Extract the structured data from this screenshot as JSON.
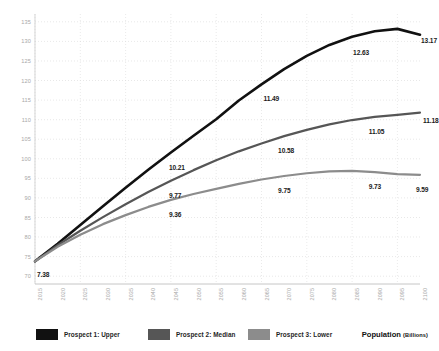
{
  "chart_data": {
    "type": "line",
    "title": "",
    "xlabel": "",
    "ylabel": "Population (Billions)",
    "ylim": [
      68,
      137
    ],
    "yticks": [
      70,
      75,
      80,
      85,
      90,
      95,
      100,
      105,
      110,
      115,
      120,
      125,
      130,
      135
    ],
    "grid": true,
    "legend_position": "bottom-left",
    "x": [
      2015,
      2020,
      2025,
      2030,
      2035,
      2040,
      2045,
      2050,
      2055,
      2060,
      2065,
      2070,
      2075,
      2080,
      2085,
      2090,
      2095,
      2100
    ],
    "xticklabels": [
      "2015",
      "2020",
      "2025",
      "2030",
      "2035",
      "2040",
      "2045",
      "2050",
      "2055",
      "2060",
      "2065",
      "2070",
      "2075",
      "2080",
      "2085",
      "2090",
      "2095",
      "2100"
    ],
    "series": [
      {
        "name": "Prospect 1: Upper",
        "color": "#111111",
        "values": [
          73.8,
          78.3,
          83.1,
          87.9,
          92.6,
          97.2,
          101.6,
          105.9,
          110.1,
          114.9,
          119.0,
          122.9,
          126.3,
          129.1,
          131.2,
          132.6,
          133.2,
          131.7
        ]
      },
      {
        "name": "Prospect 2: Median",
        "color": "#565656",
        "values": [
          73.8,
          77.9,
          81.6,
          85.1,
          88.4,
          91.5,
          94.4,
          97.1,
          99.6,
          101.9,
          103.9,
          105.8,
          107.4,
          108.8,
          109.9,
          110.7,
          111.2,
          111.8
        ]
      },
      {
        "name": "Prospect 3: Lower",
        "color": "#8c8c8c",
        "values": [
          73.8,
          77.5,
          80.6,
          83.3,
          85.6,
          87.7,
          89.5,
          91.0,
          92.3,
          93.6,
          94.7,
          95.6,
          96.3,
          96.8,
          96.9,
          96.6,
          96.1,
          95.9
        ]
      }
    ],
    "point_labels": [
      {
        "text": "7.38",
        "series": "Prospect 1: Upper",
        "x": 2015
      },
      {
        "text": "9.36",
        "series": "Prospect 3: Lower",
        "x": 2045
      },
      {
        "text": "9.77",
        "series": "Prospect 2: Median",
        "x": 2045
      },
      {
        "text": "10.21",
        "series": "Prospect 1: Upper",
        "x": 2045
      },
      {
        "text": "9.75",
        "series": "Prospect 3: Lower",
        "x": 2070
      },
      {
        "text": "10.58",
        "series": "Prospect 2: Median",
        "x": 2070
      },
      {
        "text": "11.49",
        "series": "Prospect 1: Upper",
        "x": 2065
      },
      {
        "text": "9.73",
        "series": "Prospect 3: Lower",
        "x": 2090
      },
      {
        "text": "11.05",
        "series": "Prospect 2: Median",
        "x": 2090
      },
      {
        "text": "12.63",
        "series": "Prospect 1: Upper",
        "x": 2085
      },
      {
        "text": "9.59",
        "series": "Prospect 3: Lower",
        "x": 2100
      },
      {
        "text": "11.18",
        "series": "Prospect 2: Median",
        "x": 2100
      },
      {
        "text": "13.17",
        "series": "Prospect 1: Upper",
        "x": 2100
      }
    ]
  },
  "legend": {
    "items": [
      {
        "label": "Prospect 1: Upper",
        "color": "#111111"
      },
      {
        "label": "Prospect 2: Median",
        "color": "#565656"
      },
      {
        "label": "Prospect 3: Lower",
        "color": "#8c8c8c"
      }
    ]
  },
  "axis_title": {
    "main": "Population",
    "unit": "(Billions)"
  },
  "value_labels": {
    "start": "7.38",
    "upper_2045": "10.21",
    "upper_2065": "11.49",
    "upper_2085": "12.63",
    "upper_2100": "13.17",
    "median_2045": "9.77",
    "median_2070": "10.58",
    "median_2090": "11.05",
    "median_2100": "11.18",
    "lower_2045": "9.36",
    "lower_2070": "9.75",
    "lower_2090": "9.73",
    "lower_2100": "9.59"
  }
}
